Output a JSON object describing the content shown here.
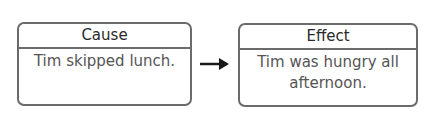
{
  "diagram": {
    "type": "cause-effect",
    "cause": {
      "header": "Cause",
      "text": "Tim skipped lunch."
    },
    "effect": {
      "header": "Effect",
      "text": "Tim was hungry all afternoon."
    },
    "connector": "arrow-right-icon",
    "colors": {
      "border": "#6b6b6b",
      "header_text": "#2a2a2a",
      "body_text": "#555555",
      "arrow": "#1a1a1a"
    }
  }
}
